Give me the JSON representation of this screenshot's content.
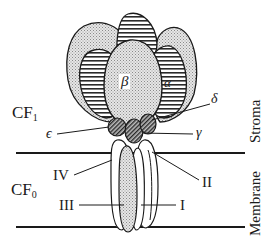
{
  "diagram": {
    "regions": {
      "cf1": {
        "label_main": "CF",
        "label_sub": "1"
      },
      "cf0": {
        "label_main": "CF",
        "label_sub": "0"
      },
      "stroma": "Stroma",
      "membrane": "Membrane"
    },
    "subunits": {
      "alpha": "α",
      "beta": "β",
      "gamma": "γ",
      "delta": "δ",
      "epsilon": "ϵ",
      "i": "I",
      "ii": "II",
      "iii": "III",
      "iv": "IV"
    },
    "colors": {
      "stroke": "#1a1a1a",
      "stipple_fill": "#d4d4d4",
      "background": "#ffffff"
    }
  }
}
